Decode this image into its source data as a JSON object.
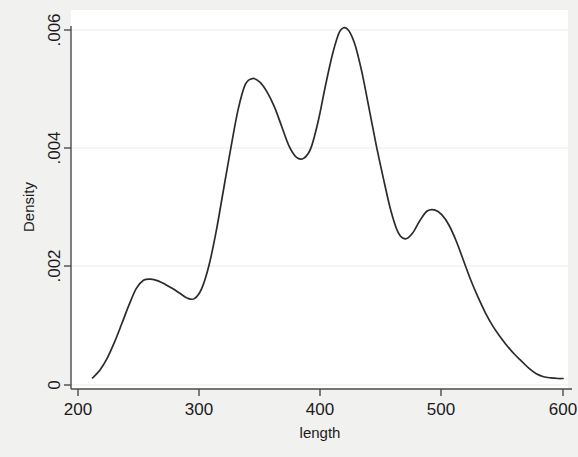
{
  "figure": {
    "background_color": "#f1f1f0",
    "plot_background_color": "#ffffff",
    "curve_color": "#2b2b2b",
    "axis_color": "#4a4a4a",
    "gridline_color": "#ebebeb"
  },
  "chart_data": {
    "type": "line",
    "title": "",
    "subtitle": "",
    "xlabel": "length",
    "ylabel": "Density",
    "xlim": [
      200,
      600
    ],
    "ylim": [
      0,
      0.0062
    ],
    "xticks": [
      200,
      300,
      400,
      500,
      600
    ],
    "xtick_labels": [
      "200",
      "300",
      "400",
      "500",
      "600"
    ],
    "yticks": [
      0,
      0.002,
      0.004,
      0.006
    ],
    "ytick_labels": [
      "0",
      ".002",
      ".004",
      ".006"
    ],
    "grid": true,
    "grid_axis": "y",
    "legend": null,
    "series": [
      {
        "name": "Kernel density of length",
        "x": [
          212,
          218,
          224,
          230,
          236,
          242,
          248,
          254,
          260,
          266,
          272,
          278,
          284,
          290,
          296,
          302,
          308,
          314,
          320,
          326,
          332,
          338,
          344,
          350,
          356,
          362,
          368,
          374,
          380,
          386,
          392,
          398,
          404,
          410,
          416,
          422,
          428,
          434,
          440,
          446,
          452,
          458,
          464,
          470,
          476,
          482,
          488,
          494,
          500,
          506,
          512,
          518,
          524,
          530,
          536,
          542,
          548,
          554,
          560,
          566,
          572,
          578,
          584,
          590,
          596,
          600
        ],
        "y": [
          0.00012,
          0.00025,
          0.00045,
          0.00072,
          0.00103,
          0.00135,
          0.00163,
          0.00177,
          0.00179,
          0.00176,
          0.0017,
          0.00163,
          0.00155,
          0.00147,
          0.00146,
          0.00163,
          0.00202,
          0.0026,
          0.0033,
          0.004,
          0.00465,
          0.00508,
          0.00518,
          0.00512,
          0.00495,
          0.0047,
          0.00437,
          0.00404,
          0.00385,
          0.00383,
          0.004,
          0.00445,
          0.00505,
          0.0056,
          0.00598,
          0.00602,
          0.00578,
          0.0053,
          0.00468,
          0.00405,
          0.00348,
          0.00295,
          0.00258,
          0.00247,
          0.00257,
          0.00278,
          0.00294,
          0.00296,
          0.00288,
          0.0027,
          0.00243,
          0.0021,
          0.00177,
          0.00148,
          0.00122,
          0.001,
          0.00082,
          0.00066,
          0.00052,
          0.0004,
          0.00028,
          0.00019,
          0.00014,
          0.00012,
          0.00011,
          0.00011
        ]
      }
    ],
    "annotations": {
      "modes": [
        {
          "x": 261,
          "y": 0.00179,
          "note": "first local mode"
        },
        {
          "x": 344,
          "y": 0.00518,
          "note": "second mode"
        },
        {
          "x": 417,
          "y": 0.00602,
          "note": "global mode"
        },
        {
          "x": 490,
          "y": 0.00296,
          "note": "fourth local mode"
        }
      ],
      "minima": [
        {
          "x": 295,
          "y": 0.00146
        },
        {
          "x": 381,
          "y": 0.00383
        },
        {
          "x": 466,
          "y": 0.00247
        }
      ]
    }
  }
}
